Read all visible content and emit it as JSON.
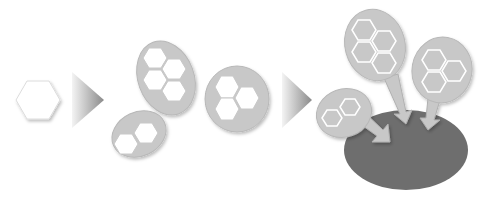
{
  "diagram": {
    "type": "process-flow",
    "stages": [
      {
        "id": "single-unit",
        "description": "single white hexagon"
      },
      {
        "id": "clusters",
        "description": "three grey ovals containing white hexagon clusters (4, 3, 2 hexagons)"
      },
      {
        "id": "binding",
        "description": "three oval clusters with arrows pointing into a dark grey oval body"
      }
    ],
    "arrows": 2,
    "colors": {
      "background": "#ffffff",
      "oval_fill": "#c8c8c8",
      "oval_stroke": "#b4b4b4",
      "hexagon_fill": "#ffffff",
      "target_body": "#6e6e6e",
      "arrow_light": "#f0f0f0",
      "arrow_dark": "#8c8c8c"
    }
  }
}
